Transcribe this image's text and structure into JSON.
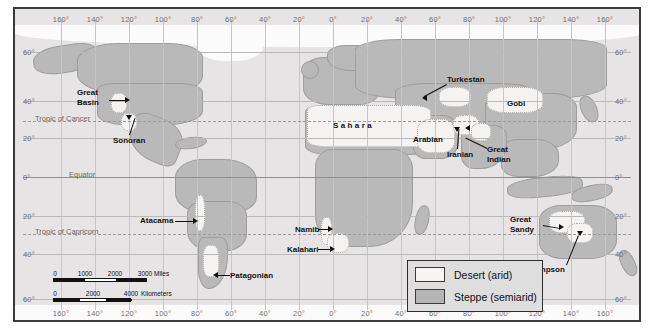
{
  "map": {
    "title": "World Map of Desert and Steppe Regions",
    "longitude_ticks_west": [
      "160°",
      "140°",
      "120°",
      "100°",
      "80°",
      "60°",
      "40°",
      "20°"
    ],
    "prime_meridian": "0°",
    "longitude_ticks_east": [
      "20°",
      "40°",
      "60°",
      "80°",
      "100°",
      "120°",
      "140°",
      "160°"
    ],
    "latitude_ticks": [
      "60°",
      "40°",
      "20°",
      "0°",
      "20°",
      "40°",
      "60°"
    ],
    "reference_lines": [
      {
        "name": "Tropic of Cancer",
        "label": "Tropic of Cancer"
      },
      {
        "name": "Equator",
        "label": "Equator"
      },
      {
        "name": "Tropic of Capricorn",
        "label": "Tropic of Capricorn"
      }
    ],
    "places": [
      {
        "id": "great-basin",
        "label": "Great\nBasin"
      },
      {
        "id": "sonoran",
        "label": "Sonoran"
      },
      {
        "id": "atacama",
        "label": "Atacama"
      },
      {
        "id": "patagonian",
        "label": "Patagonian"
      },
      {
        "id": "sahara",
        "label": "Sahara"
      },
      {
        "id": "arabian",
        "label": "Arabian"
      },
      {
        "id": "iranian",
        "label": "Iranian"
      },
      {
        "id": "turkestan",
        "label": "Turkestan"
      },
      {
        "id": "gobi",
        "label": "Gobi"
      },
      {
        "id": "great-indian",
        "label": "Great\nIndian"
      },
      {
        "id": "namib",
        "label": "Namib"
      },
      {
        "id": "kalahari",
        "label": "Kalahari"
      },
      {
        "id": "great-sandy",
        "label": "Great\nSandy"
      },
      {
        "id": "simpson",
        "label": "Simpson"
      }
    ]
  },
  "legend": {
    "desert": "Desert (arid)",
    "steppe": "Steppe (semiarid)",
    "desert_color": "#f6f5f3",
    "steppe_color": "#b5b5b5"
  },
  "scale": {
    "miles": {
      "ticks": [
        "0",
        "1000",
        "2000",
        "3000"
      ],
      "unit": "Miles"
    },
    "kilometers": {
      "ticks": [
        "0",
        "2000",
        "4000"
      ],
      "unit": "Kilometers"
    }
  }
}
